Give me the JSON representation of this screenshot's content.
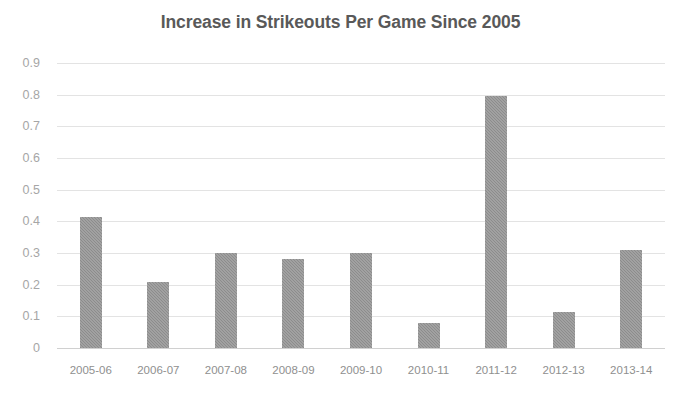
{
  "chart_data": {
    "type": "bar",
    "title": "Increase in Strikeouts Per Game Since 2005",
    "xlabel": "",
    "ylabel": "",
    "categories": [
      "2005-06",
      "2006-07",
      "2007-08",
      "2008-09",
      "2009-10",
      "2010-11",
      "2011-12",
      "2012-13",
      "2013-14"
    ],
    "values": [
      0.415,
      0.21,
      0.3,
      0.28,
      0.3,
      0.08,
      0.795,
      0.115,
      0.31
    ],
    "ylim": [
      0,
      0.9
    ],
    "y_ticks": [
      "0",
      "0.1",
      "0.2",
      "0.3",
      "0.4",
      "0.5",
      "0.6",
      "0.7",
      "0.8",
      "0.9"
    ],
    "grid": true,
    "legend": "none",
    "bar_color": "#8c8c8c",
    "gridline_color": "#e3e3e3",
    "title_color": "#595959",
    "tick_label_color": "#a6a6a6"
  }
}
